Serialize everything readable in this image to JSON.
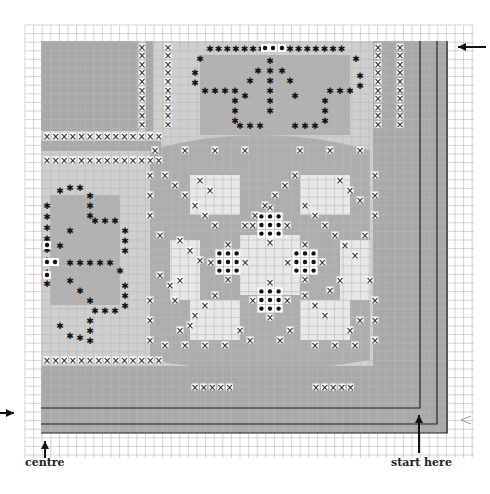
{
  "chart_data": {
    "type": "cross-stitch-chart",
    "title": "",
    "grid": {
      "x0": 25,
      "y0": 25,
      "cell": 8.6,
      "cols": 52,
      "rows": 50,
      "line_color": "#b8b8b8"
    },
    "shade_color": "#a9a9a9",
    "light_shade_color": "#cfcfcf",
    "symbols": {
      "cross": "×",
      "star": "✱",
      "dot": "●"
    },
    "labels": {
      "centre": "centre",
      "start_here": "start here"
    },
    "arrows": [
      {
        "name": "top-right-arrow",
        "direction": "left",
        "x": 468,
        "y": 47
      },
      {
        "name": "left-arrow",
        "direction": "right",
        "x": 2,
        "y": 413
      },
      {
        "name": "centre-arrow",
        "direction": "up",
        "x": 45,
        "y": 440
      },
      {
        "name": "start-here-arrow",
        "direction": "up",
        "x": 419,
        "y": 420
      },
      {
        "name": "right-chevron",
        "direction": "left-chevron",
        "x": 462,
        "y": 419
      }
    ],
    "border_lines": [
      {
        "type": "L",
        "corner_x": 420,
        "corner_y": 408
      },
      {
        "type": "L",
        "corner_x": 437,
        "corner_y": 424
      },
      {
        "type": "L",
        "corner_x": 447,
        "corner_y": 433
      }
    ]
  },
  "captions": {
    "centre": "centre",
    "start_here": "start here"
  }
}
